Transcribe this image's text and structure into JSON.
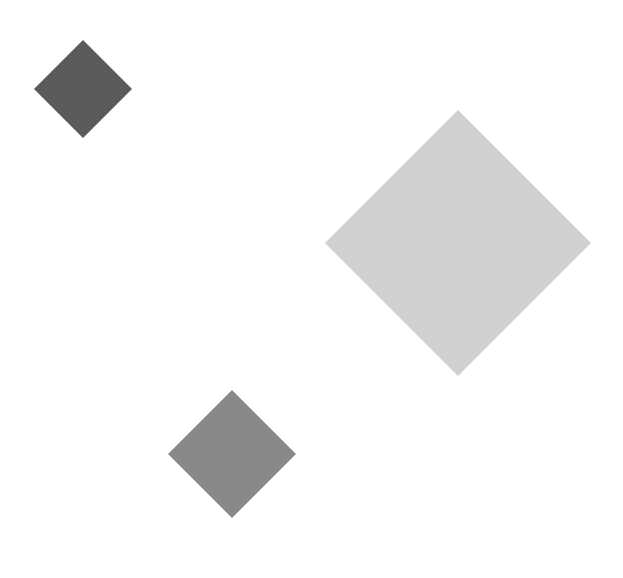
{
  "canvas": {
    "title": "Rotated squares on white background",
    "width": 623,
    "height": 578,
    "background_color": "#ffffff"
  },
  "shapes": [
    {
      "name": "small-dark-diamond",
      "kind": "square",
      "orientation": "rotated-45",
      "label": "small dark gray diamond",
      "fill_color": "#5b5b5b",
      "center_x": 83,
      "center_y": 89,
      "half_diagonal": 49,
      "side_length": 69,
      "vertices": "83,40 132,89 83,138 34,89"
    },
    {
      "name": "large-light-diamond",
      "kind": "square",
      "orientation": "rotated-45",
      "label": "large light gray diamond",
      "fill_color": "#d0d0d0",
      "center_x": 458,
      "center_y": 243,
      "half_diagonal": 133,
      "side_length": 188,
      "vertices": "458,110 591,243 458,376 325,243"
    },
    {
      "name": "medium-gray-diamond",
      "kind": "square",
      "orientation": "rotated-45",
      "label": "medium gray diamond",
      "fill_color": "#888888",
      "center_x": 232,
      "center_y": 454,
      "half_diagonal": 64,
      "side_length": 90,
      "vertices": "232,390 296,454 232,518 168,454"
    }
  ]
}
